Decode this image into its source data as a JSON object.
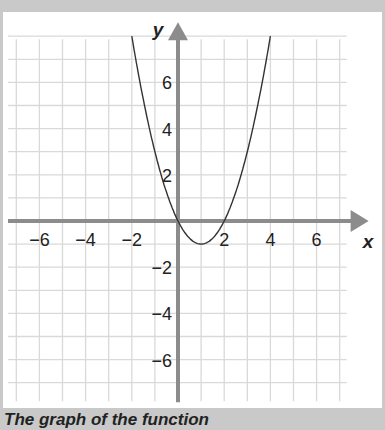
{
  "chart_data": {
    "type": "line",
    "title": "",
    "caption": "The graph of the function",
    "xlabel": "x",
    "ylabel": "y",
    "xlim": [
      -7,
      7
    ],
    "ylim": [
      -7,
      8
    ],
    "grid": true,
    "x_ticks": [
      "−6",
      "−4",
      "−2",
      "2",
      "4",
      "6"
    ],
    "y_ticks": [
      "6",
      "4",
      "2",
      "−2",
      "−4",
      "−6"
    ],
    "series": [
      {
        "name": "y = x² − 2x",
        "function": "x^2 - 2x",
        "x": [
          -2,
          -1.5,
          -1,
          -0.5,
          0,
          0.5,
          1,
          1.5,
          2,
          2.5,
          3,
          3.5,
          4
        ],
        "y": [
          8,
          5.25,
          3,
          1.25,
          0,
          -0.75,
          -1,
          -0.75,
          0,
          1.25,
          3,
          5.25,
          8
        ]
      }
    ],
    "colors": {
      "axis": "#8c8c8c",
      "grid": "#d9d9d9",
      "curve": "#333333",
      "frame": "#c9c9c9"
    }
  }
}
